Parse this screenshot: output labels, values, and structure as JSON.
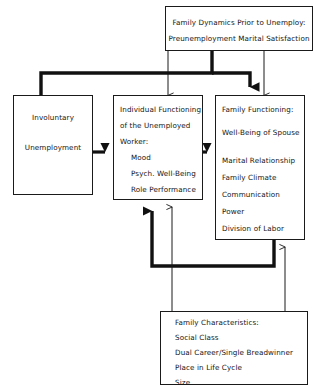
{
  "diagram": {
    "type": "flowchart",
    "background_color": "#ffffff",
    "line_color": "#1a1a1a",
    "text_color": "#141414"
  },
  "nodes": {
    "family_dynamics": {
      "id": "family-dynamics-box",
      "lines": [
        "Family Dynamics Prior to Unemploy:",
        "Preunemployment Marital Satisfaction"
      ]
    },
    "involuntary_unemployment": {
      "id": "involuntary-unemployment-box",
      "lines": [
        "Involuntary",
        "Unemployment"
      ]
    },
    "individual_functioning": {
      "id": "individual-functioning-box",
      "lines": [
        "Individual Functioning",
        "of the Unemployed",
        "Worker:",
        "Mood",
        "Psych. Well-Being",
        "Role Performance"
      ]
    },
    "family_functioning": {
      "id": "family-functioning-box",
      "lines": [
        "Family Functioning:",
        "Well-Being of Spouse",
        "Marital Relationship",
        "Family Climate",
        "Communication",
        "Power",
        "Division of Labor"
      ]
    },
    "family_characteristics": {
      "id": "family-characteristics-box",
      "lines": [
        "Family Characteristics:",
        "Social Class",
        "Dual Career/Single Breadwinner",
        "Place in Life Cycle",
        "Size"
      ]
    }
  },
  "connectors": [
    {
      "name": "dynamics-to-individual",
      "weight": "thin",
      "from": "family_dynamics",
      "to": "individual_functioning"
    },
    {
      "name": "dynamics-to-family-functioning",
      "weight": "thin",
      "from": "family_dynamics",
      "to": "family_functioning"
    },
    {
      "name": "dynamics-bus-to-unemployment",
      "weight": "thick",
      "from": "family_dynamics",
      "to": "involuntary_unemployment"
    },
    {
      "name": "dynamics-bus-to-family-functioning",
      "weight": "thick",
      "from": "family_dynamics",
      "to": "family_functioning"
    },
    {
      "name": "unemployment-to-individual",
      "weight": "thick",
      "from": "involuntary_unemployment",
      "to": "individual_functioning"
    },
    {
      "name": "individual-to-family-functioning",
      "weight": "thick",
      "from": "individual_functioning",
      "to": "family_functioning"
    },
    {
      "name": "family-functioning-feedback-to-individual",
      "weight": "thick",
      "from": "family_functioning",
      "to": "individual_functioning"
    },
    {
      "name": "characteristics-to-individual",
      "weight": "thin",
      "from": "family_characteristics",
      "to": "individual_functioning"
    },
    {
      "name": "characteristics-to-family-functioning",
      "weight": "thin",
      "from": "family_characteristics",
      "to": "family_functioning"
    }
  ]
}
